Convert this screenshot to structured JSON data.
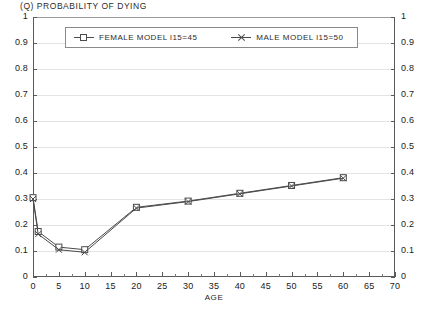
{
  "chart_data": {
    "type": "line",
    "title": "(Q) PROBABILITY OF DYING",
    "xlabel": "AGE",
    "ylabel": "",
    "xlim": [
      0,
      70
    ],
    "ylim": [
      0,
      1
    ],
    "xticks": [
      0,
      5,
      10,
      15,
      20,
      25,
      30,
      35,
      40,
      45,
      50,
      55,
      60,
      65,
      70
    ],
    "yticks": [
      0,
      0.1,
      0.2,
      0.3,
      0.4,
      0.5,
      0.6,
      0.7,
      0.8,
      0.9,
      1
    ],
    "ytick_labels": [
      "0",
      "0.1",
      "0.2",
      "0.3",
      "0.4",
      "0.5",
      "0.6",
      "0.7",
      "0.8",
      "0.9",
      "1"
    ],
    "grid": true,
    "grid_axis": "y",
    "legend_position": "top-inside",
    "dual_y_axis": true,
    "series": [
      {
        "name": "FEMALE MODEL l15=45",
        "marker": "square",
        "color": "#4a4a4a",
        "x": [
          0,
          1,
          5,
          10,
          20,
          30,
          40,
          50,
          60
        ],
        "values": [
          0.305,
          0.175,
          0.115,
          0.105,
          0.268,
          0.292,
          0.322,
          0.352,
          0.382
        ]
      },
      {
        "name": "MALE MODEL l15=50",
        "marker": "x",
        "color": "#4a4a4a",
        "x": [
          0,
          1,
          5,
          10,
          20,
          30,
          40,
          50,
          60
        ],
        "values": [
          0.3,
          0.165,
          0.105,
          0.095,
          0.265,
          0.29,
          0.32,
          0.35,
          0.38
        ]
      }
    ]
  },
  "legend": {
    "female_label": "FEMALE MODEL l15=45",
    "male_label": "MALE MODEL l15=50"
  },
  "axes": {
    "left_labels": [
      "1",
      "0.9",
      "0.8",
      "0.7",
      "0.6",
      "0.5",
      "0.4",
      "0.3",
      "0.2",
      "0.1",
      "0"
    ],
    "right_labels": [
      "1",
      "0.9",
      "0.8",
      "0.7",
      "0.6",
      "0.5",
      "0.4",
      "0.3",
      "0.2",
      "0.1",
      "0"
    ],
    "x_labels": [
      "0",
      "5",
      "10",
      "15",
      "20",
      "25",
      "30",
      "35",
      "40",
      "45",
      "50",
      "55",
      "60",
      "65",
      "70"
    ],
    "x_axis_name": "AGE"
  }
}
